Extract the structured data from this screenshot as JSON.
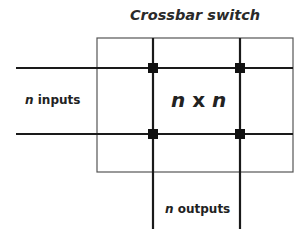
{
  "title": "Crossbar switch",
  "inputs_label": {
    "var": "n",
    "text": " inputs"
  },
  "outputs_label": {
    "var": "n",
    "text": " outputs"
  },
  "center_label": {
    "var1": "n",
    "op": " x ",
    "var2": "n"
  },
  "colors": {
    "line": "#1a1a1a",
    "box": "#555555",
    "node": "#111111",
    "text": "#222222"
  },
  "geometry": {
    "box": {
      "x": 97,
      "y": 38,
      "w": 196,
      "h": 134
    },
    "horizontal_lines_y": [
      68,
      134
    ],
    "horizontal_x_range": [
      16,
      293
    ],
    "vertical_lines_x": [
      153,
      240
    ],
    "vertical_y_range": [
      38,
      229
    ],
    "junctions": [
      [
        153,
        68
      ],
      [
        240,
        68
      ],
      [
        153,
        134
      ],
      [
        240,
        134
      ]
    ]
  }
}
